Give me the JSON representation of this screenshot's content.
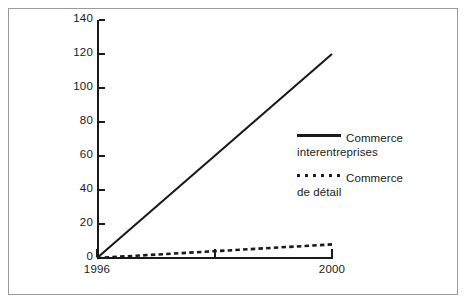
{
  "chart_data": {
    "type": "line",
    "title": "",
    "subtitle": "",
    "xlabel": "",
    "ylabel": "",
    "x": [
      1996,
      1997,
      1998,
      1999,
      2000
    ],
    "xlim": [
      1996,
      2000
    ],
    "ylim": [
      0,
      140
    ],
    "grid": false,
    "legend_position": "inside-right",
    "x_tick_labels": [
      "1996",
      "2000"
    ],
    "x_tick_values": [
      1996,
      2000
    ],
    "x_minor_tick_values": [
      1998
    ],
    "y_tick_labels": [
      "0",
      "20",
      "40",
      "60",
      "80",
      "100",
      "120",
      "140"
    ],
    "y_tick_values": [
      0,
      20,
      40,
      60,
      80,
      100,
      120,
      140
    ],
    "series": [
      {
        "name": "Commerce interentreprises",
        "name_line1": "Commerce",
        "name_line2": "interentreprises",
        "style": "solid",
        "color": "#1a1a1a",
        "values": [
          0,
          30,
          60,
          90,
          120
        ]
      },
      {
        "name": "Commerce de détail",
        "name_line1": "Commerce",
        "name_line2": "de détail",
        "style": "dotted",
        "color": "#1a1a1a",
        "values": [
          0,
          2,
          4,
          6,
          8
        ]
      }
    ]
  },
  "frame": {
    "border_color": "#9a9a9a",
    "background": "#ffffff"
  }
}
